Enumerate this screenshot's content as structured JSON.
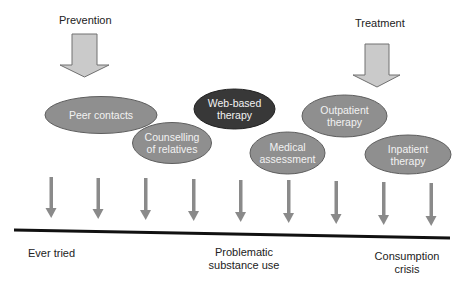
{
  "header": {
    "prevention_label": "Prevention",
    "treatment_label": "Treatment"
  },
  "interventions": [
    {
      "label": "Peer contacts",
      "style": "medium"
    },
    {
      "label": "Counselling\nof relatives",
      "style": "medium"
    },
    {
      "label": "Web-based\ntherapy",
      "style": "dark"
    },
    {
      "label": "Medical\nassessment",
      "style": "medium"
    },
    {
      "label": "Outpatient\ntherapy",
      "style": "medium"
    },
    {
      "label": "Inpatient\ntherapy",
      "style": "medium"
    }
  ],
  "timeline": {
    "arrow_count": 9,
    "stages": [
      {
        "label": "Ever tried"
      },
      {
        "label": "Problematic\nsubstance use"
      },
      {
        "label": "Consumption\ncrisis"
      }
    ]
  },
  "colors": {
    "big_arrow_fill": "#c9c9c9",
    "big_arrow_stroke": "#6e6e6e",
    "oval_medium": "#8f8f8f",
    "oval_dark": "#3a3a3a",
    "oval_stroke": "#5a5a5a",
    "small_arrow": "#8a8a8a",
    "baseline": "#111111"
  }
}
